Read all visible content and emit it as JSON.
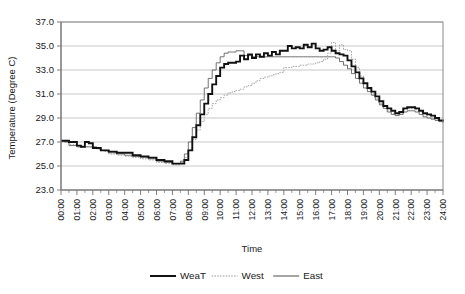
{
  "chart_data": {
    "type": "line",
    "title": "",
    "xlabel": "Time",
    "ylabel": "Temperature (Degree C)",
    "ylim": [
      23.0,
      37.0
    ],
    "ytick_step": 2.0,
    "ytick_labels": [
      "37.0",
      "35.0",
      "33.0",
      "31.0",
      "29.0",
      "27.0",
      "25.0",
      "23.0"
    ],
    "grid": true,
    "legend_position": "bottom",
    "xlim": [
      "00:00",
      "24:00"
    ],
    "categories": [
      "00:00",
      "01:00",
      "02:00",
      "03:00",
      "04:00",
      "05:00",
      "06:00",
      "07:00",
      "08:00",
      "09:00",
      "10:00",
      "11:00",
      "12:00",
      "13:00",
      "14:00",
      "15:00",
      "16:00",
      "17:00",
      "18:00",
      "19:00",
      "20:00",
      "21:00",
      "22:00",
      "23:00",
      "24:00"
    ],
    "x_minor_ticks_per_hour": 2,
    "series": [
      {
        "name": "WeaT",
        "style": "thick-solid-black",
        "color": "#111111",
        "x": [
          0.0,
          0.25,
          0.5,
          0.75,
          1.0,
          1.25,
          1.5,
          1.75,
          2.0,
          2.25,
          2.5,
          2.75,
          3.0,
          3.25,
          3.5,
          3.75,
          4.0,
          4.25,
          4.5,
          4.75,
          5.0,
          5.25,
          5.5,
          5.75,
          6.0,
          6.25,
          6.5,
          6.75,
          7.0,
          7.25,
          7.5,
          7.75,
          8.0,
          8.25,
          8.5,
          8.75,
          9.0,
          9.25,
          9.5,
          9.75,
          10.0,
          10.25,
          10.5,
          10.75,
          11.0,
          11.25,
          11.5,
          11.75,
          12.0,
          12.25,
          12.5,
          12.75,
          13.0,
          13.25,
          13.5,
          13.75,
          14.0,
          14.25,
          14.5,
          14.75,
          15.0,
          15.25,
          15.5,
          15.75,
          16.0,
          16.25,
          16.5,
          16.75,
          17.0,
          17.25,
          17.5,
          17.75,
          18.0,
          18.25,
          18.5,
          18.75,
          19.0,
          19.25,
          19.5,
          19.75,
          20.0,
          20.25,
          20.5,
          20.75,
          21.0,
          21.25,
          21.5,
          21.75,
          22.0,
          22.25,
          22.5,
          22.75,
          23.0,
          23.25,
          23.5,
          23.75,
          24.0
        ],
        "y": [
          27.1,
          27.1,
          27.0,
          27.0,
          26.7,
          26.6,
          27.0,
          26.9,
          26.5,
          26.5,
          26.3,
          26.3,
          26.2,
          26.2,
          26.1,
          26.1,
          26.1,
          26.1,
          25.9,
          25.9,
          25.8,
          25.8,
          25.7,
          25.7,
          25.5,
          25.5,
          25.4,
          25.4,
          25.2,
          25.2,
          25.2,
          25.5,
          26.3,
          27.4,
          28.4,
          29.3,
          30.2,
          31.0,
          31.8,
          32.5,
          33.2,
          33.5,
          33.6,
          33.6,
          33.7,
          34.2,
          33.9,
          34.3,
          34.0,
          34.3,
          34.1,
          34.4,
          34.2,
          34.5,
          34.3,
          34.6,
          34.6,
          35.0,
          34.8,
          34.9,
          34.8,
          35.1,
          34.9,
          35.2,
          34.8,
          34.6,
          34.7,
          34.9,
          34.6,
          34.4,
          34.3,
          34.2,
          33.8,
          33.3,
          32.8,
          32.3,
          31.9,
          31.5,
          31.2,
          30.8,
          30.4,
          30.0,
          29.8,
          29.6,
          29.4,
          29.5,
          29.8,
          29.9,
          29.9,
          29.8,
          29.6,
          29.4,
          29.3,
          29.2,
          29.0,
          28.8,
          28.7
        ]
      },
      {
        "name": "West",
        "style": "dotted-light-gray",
        "color": "#9d9d9d",
        "x": [
          0.0,
          0.25,
          0.5,
          0.75,
          1.0,
          1.25,
          1.5,
          1.75,
          2.0,
          2.25,
          2.5,
          2.75,
          3.0,
          3.25,
          3.5,
          3.75,
          4.0,
          4.25,
          4.5,
          4.75,
          5.0,
          5.25,
          5.5,
          5.75,
          6.0,
          6.25,
          6.5,
          6.75,
          7.0,
          7.25,
          7.5,
          7.75,
          8.0,
          8.25,
          8.5,
          8.75,
          9.0,
          9.25,
          9.5,
          9.75,
          10.0,
          10.25,
          10.5,
          10.75,
          11.0,
          11.25,
          11.5,
          11.75,
          12.0,
          12.25,
          12.5,
          12.75,
          13.0,
          13.25,
          13.5,
          13.75,
          14.0,
          14.25,
          14.5,
          14.75,
          15.0,
          15.25,
          15.5,
          15.75,
          16.0,
          16.25,
          16.5,
          16.75,
          17.0,
          17.25,
          17.5,
          17.75,
          18.0,
          18.25,
          18.5,
          18.75,
          19.0,
          19.25,
          19.5,
          19.75,
          20.0,
          20.25,
          20.5,
          20.75,
          21.0,
          21.25,
          21.5,
          21.75,
          22.0,
          22.25,
          22.5,
          22.75,
          23.0,
          23.25,
          23.5,
          23.75,
          24.0
        ],
        "y": [
          27.0,
          27.0,
          26.8,
          26.8,
          26.6,
          26.6,
          26.6,
          26.6,
          26.5,
          26.4,
          26.3,
          26.2,
          26.0,
          26.0,
          25.9,
          25.9,
          25.8,
          25.8,
          25.7,
          25.7,
          25.6,
          25.6,
          25.5,
          25.5,
          25.3,
          25.3,
          25.2,
          25.2,
          25.1,
          25.1,
          25.3,
          25.7,
          26.4,
          27.2,
          28.0,
          28.7,
          29.3,
          29.8,
          30.2,
          30.5,
          30.7,
          30.9,
          31.1,
          31.2,
          31.3,
          31.4,
          31.6,
          31.7,
          31.9,
          32.1,
          32.3,
          32.4,
          32.5,
          32.6,
          32.7,
          32.8,
          33.2,
          33.2,
          33.3,
          33.3,
          33.4,
          33.4,
          33.5,
          33.5,
          33.6,
          33.7,
          33.9,
          34.4,
          35.3,
          34.6,
          35.1,
          34.7,
          34.6,
          33.9,
          33.2,
          32.5,
          31.9,
          31.4,
          31.0,
          30.6,
          30.2,
          29.8,
          29.6,
          29.4,
          29.3,
          29.4,
          29.7,
          29.8,
          29.8,
          29.7,
          29.5,
          29.3,
          29.2,
          29.0,
          28.9,
          28.8,
          28.7
        ]
      },
      {
        "name": "East",
        "style": "thin-solid-gray",
        "color": "#5a5a5a",
        "x": [
          0.0,
          0.25,
          0.5,
          0.75,
          1.0,
          1.25,
          1.5,
          1.75,
          2.0,
          2.25,
          2.5,
          2.75,
          3.0,
          3.25,
          3.5,
          3.75,
          4.0,
          4.25,
          4.5,
          4.75,
          5.0,
          5.25,
          5.5,
          5.75,
          6.0,
          6.25,
          6.5,
          6.75,
          7.0,
          7.25,
          7.5,
          7.75,
          8.0,
          8.25,
          8.5,
          8.75,
          9.0,
          9.25,
          9.5,
          9.75,
          10.0,
          10.25,
          10.5,
          10.75,
          11.0,
          11.25,
          11.5,
          11.75,
          12.0,
          12.25,
          12.5,
          12.75,
          13.0,
          13.25,
          13.5,
          13.75,
          14.0,
          14.25,
          14.5,
          14.75,
          15.0,
          15.25,
          15.5,
          15.75,
          16.0,
          16.25,
          16.5,
          16.75,
          17.0,
          17.25,
          17.5,
          17.75,
          18.0,
          18.25,
          18.5,
          18.75,
          19.0,
          19.25,
          19.5,
          19.75,
          20.0,
          20.25,
          20.5,
          20.75,
          21.0,
          21.25,
          21.5,
          21.75,
          22.0,
          22.25,
          22.5,
          22.75,
          23.0,
          23.25,
          23.5,
          23.75,
          24.0
        ],
        "y": [
          27.1,
          27.0,
          26.7,
          26.7,
          26.6,
          26.6,
          26.6,
          26.6,
          26.6,
          26.5,
          26.3,
          26.3,
          26.1,
          26.1,
          26.0,
          26.0,
          25.9,
          25.9,
          25.8,
          25.8,
          25.7,
          25.7,
          25.6,
          25.6,
          25.4,
          25.4,
          25.3,
          25.3,
          25.2,
          25.2,
          25.4,
          26.0,
          27.0,
          28.2,
          29.4,
          30.5,
          31.5,
          32.3,
          33.0,
          33.6,
          34.1,
          34.4,
          34.5,
          34.5,
          34.6,
          34.6,
          34.2,
          34.2,
          34.1,
          34.1,
          34.1,
          34.1,
          34.1,
          34.1,
          34.1,
          34.1,
          34.1,
          34.1,
          34.1,
          34.1,
          34.1,
          34.1,
          34.1,
          34.1,
          34.1,
          34.1,
          34.1,
          34.1,
          34.1,
          34.0,
          33.7,
          33.4,
          33.1,
          32.7,
          32.3,
          31.9,
          31.5,
          31.2,
          30.9,
          30.5,
          30.1,
          29.8,
          29.5,
          29.3,
          29.2,
          29.3,
          29.5,
          29.6,
          29.6,
          29.5,
          29.3,
          29.1,
          29.0,
          28.9,
          28.8,
          28.7,
          28.6
        ]
      }
    ],
    "legend": [
      {
        "label": "WeaT",
        "color": "#111111",
        "style": "thick-solid"
      },
      {
        "label": "West",
        "color": "#9d9d9d",
        "style": "dotted"
      },
      {
        "label": "East",
        "color": "#5a5a5a",
        "style": "thin-solid"
      }
    ]
  }
}
